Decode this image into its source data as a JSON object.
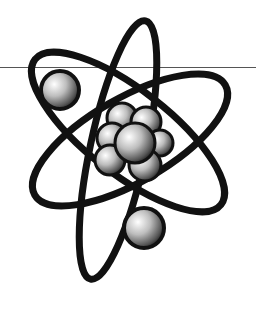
{
  "image": {
    "subject": "atom clip-art",
    "description": "Black and white illustration of an atom with three elliptical electron orbits, a nucleus of shaded spheres, and two electrons",
    "colors": {
      "background": "#ffffff",
      "ink": "#111111",
      "rule": "#555555"
    }
  }
}
